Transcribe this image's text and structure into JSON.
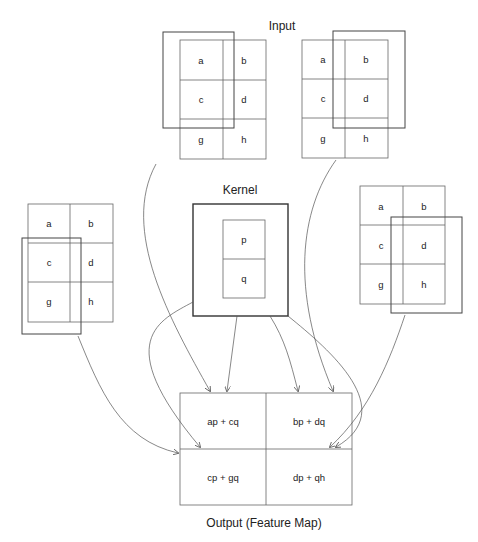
{
  "header": {
    "partial_text": ""
  },
  "labels": {
    "input": "Input",
    "kernel": "Kernel",
    "output": "Output (Feature Map)"
  },
  "input": {
    "cells": [
      [
        "a",
        "b"
      ],
      [
        "c",
        "d"
      ],
      [
        "g",
        "h"
      ]
    ],
    "positions": [
      {
        "name": "top-left",
        "window": "a,c"
      },
      {
        "name": "top-right",
        "window": "b,d"
      },
      {
        "name": "bottom-left",
        "window": "c,g"
      },
      {
        "name": "bottom-right",
        "window": "d,h"
      }
    ]
  },
  "kernel": {
    "cells": [
      "p",
      "q"
    ]
  },
  "output": {
    "cells": [
      [
        "ap + cq",
        "bp + dq"
      ],
      [
        "cp + gq",
        "dp + qh"
      ]
    ]
  },
  "colors": {
    "line": "#555555",
    "text": "#222222",
    "background": "#ffffff"
  }
}
